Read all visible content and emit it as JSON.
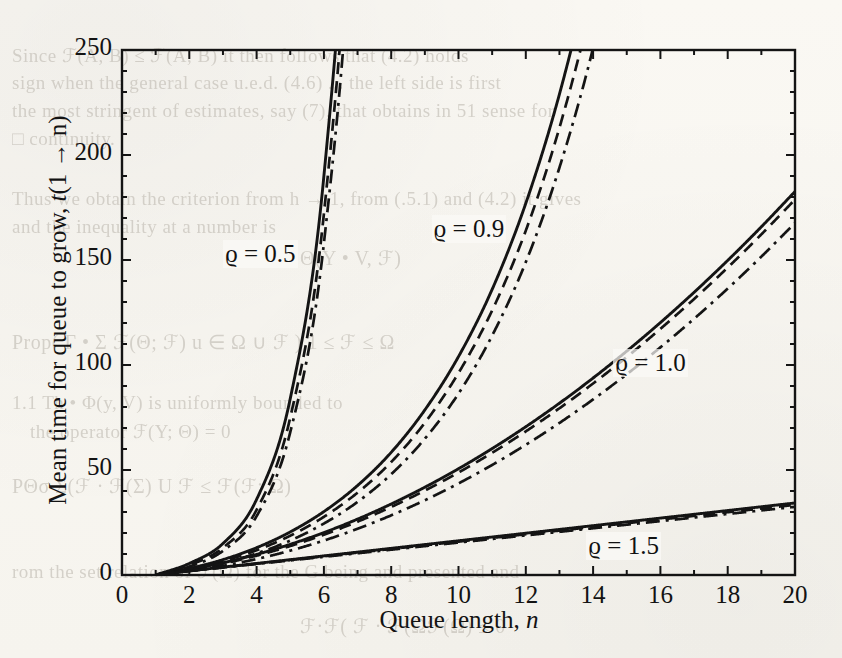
{
  "figure": {
    "kind": "scanned-journal-figure",
    "background_color": "#fbfaf7",
    "ink_color": "#141414"
  },
  "axes": {
    "x": {
      "label_plain": "Queue length, n",
      "label_main": "Queue length,",
      "label_var": "n",
      "ticks": [
        "0",
        "2",
        "4",
        "6",
        "8",
        "10",
        "12",
        "14",
        "16",
        "18",
        "20"
      ],
      "tick_values": [
        0,
        2,
        4,
        6,
        8,
        10,
        12,
        14,
        16,
        18,
        20
      ],
      "minor_step": 1,
      "range": [
        0,
        20
      ]
    },
    "y": {
      "label_plain": "Mean time for queue to grow, t(1 → n)",
      "label_main": "Mean time for queue to grow,",
      "label_var": "t",
      "label_arg": "(1 → n)",
      "ticks": [
        "0",
        "50",
        "100",
        "150",
        "200",
        "250"
      ],
      "tick_values": [
        0,
        50,
        100,
        150,
        200,
        250
      ],
      "minor_step": 10,
      "range": [
        0,
        250
      ]
    }
  },
  "annotations": [
    {
      "name": "rho-0-5",
      "text": "ϱ = 0.5",
      "symbol": "ϱ",
      "value": "0.5",
      "x_data": 3.0,
      "y_data": 152
    },
    {
      "name": "rho-0-9",
      "text": "ϱ = 0.9",
      "symbol": "ϱ",
      "value": "0.9",
      "x_data": 9.2,
      "y_data": 164
    },
    {
      "name": "rho-1-0",
      "text": "ϱ = 1.0",
      "symbol": "ϱ",
      "value": "1.0",
      "x_data": 14.6,
      "y_data": 100
    },
    {
      "name": "rho-1-5",
      "text": "ϱ = 1.5",
      "symbol": "ϱ",
      "value": "1.5",
      "x_data": 13.8,
      "y_data": 13
    }
  ],
  "linestyles": {
    "solid": {
      "name": "solid",
      "dash": "none",
      "label": "——"
    },
    "dashed": {
      "name": "dashed",
      "dash": "12,7",
      "label": "– –"
    },
    "dashdot": {
      "name": "dashdot",
      "dash": "14,6,3,6",
      "label": "– · –"
    }
  },
  "chart_data": {
    "type": "line",
    "title": "",
    "xlabel": "Queue length, n",
    "ylabel": "Mean time for queue to grow, t(1 → n)",
    "xlim": [
      0,
      20
    ],
    "ylim": [
      0,
      250
    ],
    "grid": false,
    "legend": "inline-annotations",
    "x": [
      1,
      2,
      3,
      4,
      5,
      6,
      7,
      8,
      9,
      10,
      11,
      12,
      13,
      14,
      15,
      16,
      17,
      18,
      19,
      20
    ],
    "series": [
      {
        "name": "ϱ = 0.5, solid",
        "rho": 0.5,
        "style": "solid",
        "group": "0.5",
        "values": [
          0,
          5.5,
          15,
          36,
          84,
          190,
          420,
          900,
          1900,
          4000,
          8200,
          17000,
          35000,
          72000,
          148000,
          305000,
          625000,
          1280000,
          2620000,
          5350000
        ]
      },
      {
        "name": "ϱ = 0.5, dashed",
        "rho": 0.5,
        "style": "dashed",
        "group": "0.5",
        "values": [
          0,
          4.6,
          13,
          31,
          75,
          172,
          385,
          830,
          1760,
          3700,
          7700,
          16000,
          33000,
          68000,
          140000,
          288000,
          590000,
          1210000,
          2480000,
          5060000
        ]
      },
      {
        "name": "ϱ = 0.5, dash-dot",
        "rho": 0.5,
        "style": "dashdot",
        "group": "0.5",
        "values": [
          0,
          4.0,
          11.5,
          28,
          68,
          158,
          356,
          770,
          1640,
          3460,
          7200,
          15000,
          31000,
          64000,
          132000,
          272000,
          558000,
          1145000,
          2350000,
          4800000
        ]
      },
      {
        "name": "ϱ = 0.9, solid",
        "rho": 0.9,
        "style": "solid",
        "group": "0.9",
        "values": [
          0,
          3.1,
          7.3,
          13.0,
          20.5,
          30.2,
          42.6,
          58.4,
          78.6,
          104,
          136,
          177,
          229,
          295,
          378,
          484,
          618,
          787,
          1001,
          1272
        ]
      },
      {
        "name": "ϱ = 0.9, dashed",
        "rho": 0.9,
        "style": "dashed",
        "group": "0.9",
        "values": [
          0,
          2.8,
          6.6,
          11.8,
          18.7,
          27.7,
          39.2,
          53.8,
          72.5,
          96.2,
          126,
          164,
          213,
          275,
          353,
          452,
          578,
          737,
          938,
          1193
        ]
      },
      {
        "name": "ϱ = 0.9, dash-dot",
        "rho": 0.9,
        "style": "dashdot",
        "group": "0.9",
        "values": [
          0,
          2.4,
          5.7,
          10.3,
          16.4,
          24.5,
          34.8,
          48.0,
          64.9,
          86.4,
          114,
          149,
          194,
          251,
          324,
          416,
          533,
          681,
          868,
          1105
        ]
      },
      {
        "name": "ϱ = 1.0, solid",
        "rho": 1.0,
        "style": "solid",
        "group": "1.0",
        "values": [
          0,
          2.6,
          5.8,
          9.8,
          14.6,
          20.2,
          26.6,
          33.8,
          41.8,
          50.6,
          60.2,
          70.6,
          81.8,
          93.8,
          106.6,
          120.2,
          134.6,
          149.8,
          165.8,
          182.6
        ]
      },
      {
        "name": "ϱ = 1.0, dashed",
        "rho": 1.0,
        "style": "dashed",
        "group": "1.0",
        "values": [
          0,
          2.4,
          5.4,
          9.2,
          13.8,
          19.2,
          25.4,
          32.4,
          40.2,
          48.8,
          58.2,
          68.4,
          79.4,
          91.2,
          103.8,
          117.2,
          131.4,
          146.4,
          162.2,
          178.8
        ]
      },
      {
        "name": "ϱ = 1.0, dash-dot",
        "rho": 1.0,
        "style": "dashdot",
        "group": "1.0",
        "values": [
          0,
          2.0,
          4.4,
          7.6,
          11.6,
          16.4,
          22.0,
          28.4,
          35.6,
          43.6,
          52.4,
          62.0,
          72.4,
          83.6,
          95.6,
          108.4,
          122.0,
          136.4,
          151.6,
          167.6
        ]
      },
      {
        "name": "ϱ = 1.5, solid",
        "rho": 1.5,
        "style": "solid",
        "group": "1.5",
        "values": [
          0,
          1.95,
          3.75,
          5.5,
          7.3,
          9.1,
          10.9,
          12.7,
          14.5,
          16.3,
          18.1,
          19.9,
          21.7,
          23.5,
          25.3,
          27.1,
          28.9,
          30.7,
          32.5,
          34.3
        ]
      },
      {
        "name": "ϱ = 1.5, dashed",
        "rho": 1.5,
        "style": "dashed",
        "group": "1.5",
        "values": [
          0,
          1.9,
          3.65,
          5.4,
          7.15,
          8.9,
          10.65,
          12.4,
          14.15,
          15.9,
          17.65,
          19.4,
          21.15,
          22.9,
          24.65,
          26.4,
          28.15,
          29.9,
          31.65,
          33.4
        ]
      },
      {
        "name": "ϱ = 1.5, dash-dot",
        "rho": 1.5,
        "style": "dashdot",
        "group": "1.5",
        "values": [
          0,
          1.85,
          3.55,
          5.25,
          6.95,
          8.65,
          10.35,
          12.05,
          13.75,
          15.45,
          17.15,
          18.85,
          20.55,
          22.25,
          23.95,
          25.65,
          27.35,
          29.05,
          30.75,
          32.45
        ]
      }
    ]
  },
  "scan_artifacts": {
    "note": "faint show-through text from the reverse of the printed page",
    "lines": [
      {
        "text": "Since ℱ(A, B) ≤ ℱ(A, B) it then follows that (4.2) holds",
        "x": 12,
        "y": 44,
        "size": 19,
        "rot": 0
      },
      {
        "text": "sign when the general case u.e.d. (4.6) ... the  left side is first",
        "x": 12,
        "y": 72,
        "size": 19,
        "rot": 0
      },
      {
        "text": "the most stringent of estimates, say (7), that obtains in  51 sense for",
        "x": 12,
        "y": 100,
        "size": 19,
        "rot": 0
      },
      {
        "text": "□ continuity.",
        "x": 12,
        "y": 128,
        "size": 19,
        "rot": 0
      },
      {
        "text": "Thus we obtain the  criterion from  h → 1,  from  (.5.1) and  (4.2) it  gives",
        "x": 12,
        "y": 188,
        "size": 19,
        "rot": 0
      },
      {
        "text": "and  the  inequality  at  a  number  is",
        "x": 12,
        "y": 216,
        "size": 19,
        "rot": 0
      },
      {
        "text": "Θ(Y • V, ℱ)",
        "x": 300,
        "y": 246,
        "size": 20,
        "rot": 0
      },
      {
        "text": "Prop( Γ • Σ ℱ(Θ; ℱ) u ∈ Ω ∪ ℱ )  1 ≤ ℱ ≤ Ω",
        "x": 12,
        "y": 330,
        "size": 20,
        "rot": 0
      },
      {
        "text": "1.1 Th • Φ(y, V) is  uniformly  bounded  to",
        "x": 12,
        "y": 392,
        "size": 19,
        "rot": 0
      },
      {
        "text": "the  operator  ℱ(Y; Θ) =  0",
        "x": 30,
        "y": 420,
        "size": 19,
        "rot": 0
      },
      {
        "text": "PΘσ    Σ(ℱ · ℱ(Σ) U  ℱ ≤ ℱ(ℱ; Ω)",
        "x": 12,
        "y": 474,
        "size": 20,
        "rot": 0
      },
      {
        "text": "rom  the  set  relation  of  ℱ(Ω)   for  the    G  being  and  presented  and",
        "x": 12,
        "y": 560,
        "size": 19,
        "rot": 0
      },
      {
        "text": "ℱ·ℱ( ℱ · ℱ(Ωℱ(Ω) ≤ 0",
        "x": 300,
        "y": 614,
        "size": 20,
        "rot": 0
      }
    ]
  }
}
